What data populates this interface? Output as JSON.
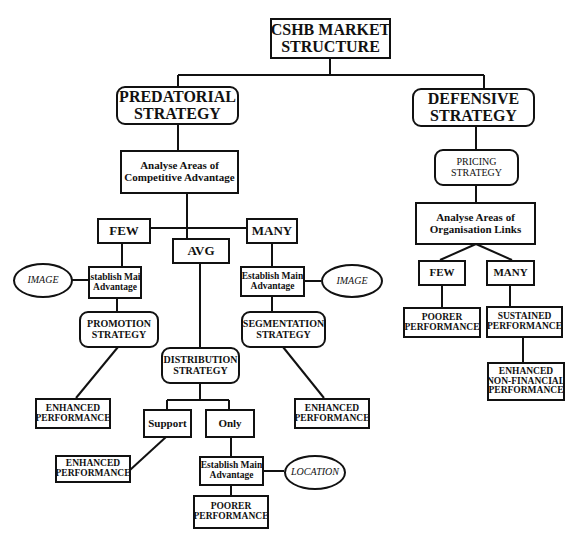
{
  "diagram": {
    "title": [
      "CSHB MARKET",
      "STRUCTURE"
    ],
    "predatorial": {
      "title": [
        "PREDATORIAL",
        "STRATEGY"
      ],
      "analyse": [
        "Analyse Areas of",
        "Competitive Advantage"
      ],
      "few": "FEW",
      "avg": "AVG",
      "many": "MANY",
      "few_branch": {
        "establish": [
          "Establish Main",
          "Advantage"
        ],
        "image": "IMAGE",
        "strategy": [
          "PROMOTION",
          "STRATEGY"
        ],
        "outcome": [
          "ENHANCED",
          "PERFORMANCE"
        ]
      },
      "many_branch": {
        "establish": [
          "Establish Main",
          "Advantage"
        ],
        "image": "IMAGE",
        "strategy": [
          "SEGMENTATION",
          "STRATEGY"
        ],
        "outcome": [
          "ENHANCED",
          "PERFORMANCE"
        ]
      },
      "avg_branch": {
        "strategy": [
          "DISTRIBUTION",
          "STRATEGY"
        ],
        "support": "Support",
        "support_outcome": [
          "ENHANCED",
          "PERFORMANCE"
        ],
        "only": "Only",
        "establish": [
          "Establish Main",
          "Advantage"
        ],
        "location": "LOCATION",
        "only_outcome": [
          "POORER",
          "PERFORMANCE"
        ]
      }
    },
    "defensive": {
      "title": [
        "DEFENSIVE",
        "STRATEGY"
      ],
      "pricing": [
        "PRICING",
        "STRATEGY"
      ],
      "analyse": [
        "Analyse Areas of",
        "Organisation Links"
      ],
      "few": "FEW",
      "many": "MANY",
      "few_outcome": [
        "POORER",
        "PERFORMANCE"
      ],
      "many_outcome": [
        "SUSTAINED",
        "PERFORMANCE"
      ],
      "final_outcome": [
        "ENHANCED",
        "NON-FINANCIAL",
        "PERFORMANCE"
      ]
    }
  }
}
